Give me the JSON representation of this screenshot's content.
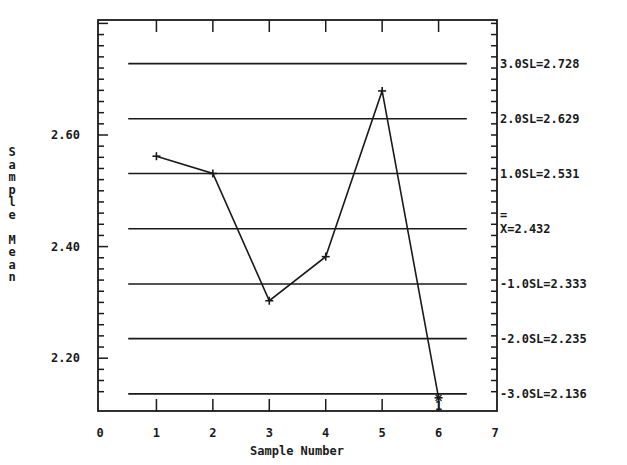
{
  "chart_data": {
    "type": "line",
    "title": "",
    "xlabel": "Sample Number",
    "ylabel": "Sample Mean",
    "x": [
      1,
      2,
      3,
      4,
      5,
      6
    ],
    "series": [
      {
        "name": "Sample Mean",
        "values": [
          2.562,
          2.531,
          2.303,
          2.382,
          2.679,
          2.129
        ]
      }
    ],
    "xlim": [
      0,
      7
    ],
    "ylim": [
      2.13,
      2.83
    ],
    "x_ticks": [
      "0",
      "1",
      "2",
      "3",
      "4",
      "5",
      "6",
      "7"
    ],
    "y_ticks": [
      "2.20",
      "2.40",
      "2.60"
    ],
    "control_lines": [
      {
        "label": "3.0SL=2.728",
        "value": 2.728
      },
      {
        "label": "2.0SL=2.629",
        "value": 2.629
      },
      {
        "label": "1.0SL=2.531",
        "value": 2.531
      },
      {
        "label": "X=2.432",
        "value": 2.432,
        "is_center": true
      },
      {
        "label": "-1.0SL=2.333",
        "value": 2.333
      },
      {
        "label": "-2.0SL=2.235",
        "value": 2.235
      },
      {
        "label": "-3.0SL=2.136",
        "value": 2.136
      }
    ],
    "annotations": [
      {
        "x": 6,
        "text": "1",
        "note": "out-of-control flag below point 6"
      }
    ],
    "grid": false,
    "legend": "none"
  },
  "axes": {
    "xlabel": "Sample Number",
    "ylabel_chars": [
      "S",
      "a",
      "m",
      "p",
      "l",
      "e",
      "",
      "M",
      "e",
      "a",
      "n"
    ]
  }
}
